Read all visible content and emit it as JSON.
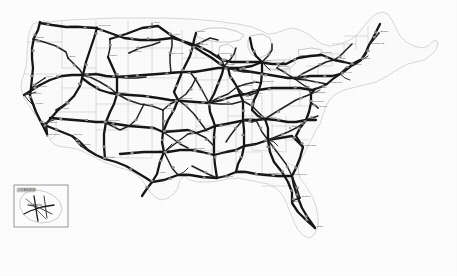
{
  "figure": {
    "kind": "scanned-map",
    "region": "Contiguous United States",
    "render_style": "grayscale line scan",
    "background_color": "#ffffff",
    "road_color": "#161616",
    "border_color": "#b9b9b9",
    "coast_color": "#9a9a9a",
    "width_px": 457,
    "height_px": 276,
    "title": "",
    "caption": "",
    "legend": ""
  },
  "inset": {
    "present": true,
    "label": "LOS ANGELES",
    "sub_label": "AREA",
    "box": {
      "x": 14,
      "y": 185,
      "w": 54,
      "h": 42
    }
  },
  "cities": [
    {
      "name": "Seattle",
      "x": 40,
      "y": 24
    },
    {
      "name": "Spokane",
      "x": 68,
      "y": 27
    },
    {
      "name": "Portland",
      "x": 33,
      "y": 39
    },
    {
      "name": "Boise",
      "x": 68,
      "y": 58
    },
    {
      "name": "Billings",
      "x": 110,
      "y": 39
    },
    {
      "name": "Great Falls",
      "x": 97,
      "y": 27
    },
    {
      "name": "Minot",
      "x": 152,
      "y": 24
    },
    {
      "name": "Fargo",
      "x": 172,
      "y": 36
    },
    {
      "name": "Duluth",
      "x": 196,
      "y": 33
    },
    {
      "name": "Minneapolis",
      "x": 193,
      "y": 46
    },
    {
      "name": "Rapid City",
      "x": 129,
      "y": 53
    },
    {
      "name": "Sioux Falls",
      "x": 170,
      "y": 55
    },
    {
      "name": "Casper",
      "x": 108,
      "y": 57
    },
    {
      "name": "Salt Lake City",
      "x": 83,
      "y": 75
    },
    {
      "name": "Reno",
      "x": 45,
      "y": 78
    },
    {
      "name": "Sacramento",
      "x": 32,
      "y": 88
    },
    {
      "name": "San Francisco",
      "x": 24,
      "y": 95
    },
    {
      "name": "Fresno",
      "x": 34,
      "y": 105
    },
    {
      "name": "Las Vegas",
      "x": 56,
      "y": 110
    },
    {
      "name": "Los Angeles",
      "x": 42,
      "y": 124
    },
    {
      "name": "San Diego",
      "x": 47,
      "y": 136
    },
    {
      "name": "Phoenix",
      "x": 72,
      "y": 136
    },
    {
      "name": "Tucson",
      "x": 81,
      "y": 146
    },
    {
      "name": "Albuquerque",
      "x": 104,
      "y": 122
    },
    {
      "name": "Denver",
      "x": 117,
      "y": 94
    },
    {
      "name": "Cheyenne",
      "x": 117,
      "y": 77
    },
    {
      "name": "El Paso",
      "x": 105,
      "y": 159
    },
    {
      "name": "Amarillo",
      "x": 129,
      "y": 126
    },
    {
      "name": "Oklahoma City",
      "x": 163,
      "y": 132
    },
    {
      "name": "Wichita",
      "x": 163,
      "y": 110
    },
    {
      "name": "Omaha",
      "x": 171,
      "y": 73
    },
    {
      "name": "Des Moines",
      "x": 190,
      "y": 72
    },
    {
      "name": "Kansas City",
      "x": 178,
      "y": 100
    },
    {
      "name": "St. Louis",
      "x": 209,
      "y": 103
    },
    {
      "name": "Chicago",
      "x": 224,
      "y": 66
    },
    {
      "name": "Milwaukee",
      "x": 218,
      "y": 55
    },
    {
      "name": "Detroit",
      "x": 262,
      "y": 62
    },
    {
      "name": "Indianapolis",
      "x": 237,
      "y": 87
    },
    {
      "name": "Cincinnati",
      "x": 250,
      "y": 95
    },
    {
      "name": "Louisville",
      "x": 243,
      "y": 101
    },
    {
      "name": "Cleveland",
      "x": 277,
      "y": 68
    },
    {
      "name": "Columbus",
      "x": 261,
      "y": 83
    },
    {
      "name": "Pittsburgh",
      "x": 295,
      "y": 79
    },
    {
      "name": "Buffalo",
      "x": 300,
      "y": 57
    },
    {
      "name": "Nashville",
      "x": 243,
      "y": 120
    },
    {
      "name": "Memphis",
      "x": 215,
      "y": 126
    },
    {
      "name": "Little Rock",
      "x": 196,
      "y": 133
    },
    {
      "name": "Dallas",
      "x": 164,
      "y": 152
    },
    {
      "name": "Fort Worth",
      "x": 157,
      "y": 152
    },
    {
      "name": "Austin",
      "x": 157,
      "y": 174
    },
    {
      "name": "San Antonio",
      "x": 152,
      "y": 182
    },
    {
      "name": "Houston",
      "x": 178,
      "y": 175
    },
    {
      "name": "New Orleans",
      "x": 217,
      "y": 178
    },
    {
      "name": "Shreveport",
      "x": 191,
      "y": 150
    },
    {
      "name": "Jackson",
      "x": 214,
      "y": 155
    },
    {
      "name": "Birmingham",
      "x": 244,
      "y": 146
    },
    {
      "name": "Atlanta",
      "x": 268,
      "y": 140
    },
    {
      "name": "Mobile",
      "x": 236,
      "y": 172
    },
    {
      "name": "Tallahassee",
      "x": 267,
      "y": 175
    },
    {
      "name": "Jacksonville",
      "x": 292,
      "y": 176
    },
    {
      "name": "Orlando",
      "x": 300,
      "y": 198
    },
    {
      "name": "Tampa",
      "x": 292,
      "y": 203
    },
    {
      "name": "Miami",
      "x": 315,
      "y": 228
    },
    {
      "name": "Knoxville",
      "x": 265,
      "y": 119
    },
    {
      "name": "Charlotte",
      "x": 290,
      "y": 128
    },
    {
      "name": "Charleston",
      "x": 303,
      "y": 147
    },
    {
      "name": "Raleigh",
      "x": 306,
      "y": 120
    },
    {
      "name": "Richmond",
      "x": 311,
      "y": 103
    },
    {
      "name": "Norfolk",
      "x": 318,
      "y": 108
    },
    {
      "name": "Washington",
      "x": 311,
      "y": 94
    },
    {
      "name": "Baltimore",
      "x": 315,
      "y": 89
    },
    {
      "name": "Philadelphia",
      "x": 327,
      "y": 84
    },
    {
      "name": "New York",
      "x": 340,
      "y": 74
    },
    {
      "name": "Hartford",
      "x": 351,
      "y": 66
    },
    {
      "name": "Boston",
      "x": 361,
      "y": 60
    },
    {
      "name": "Portland ME",
      "x": 369,
      "y": 45
    },
    {
      "name": "Albany",
      "x": 337,
      "y": 60
    },
    {
      "name": "Syracuse",
      "x": 320,
      "y": 54
    },
    {
      "name": "Bangor",
      "x": 379,
      "y": 33
    }
  ],
  "routes": [
    {
      "id": "I-5",
      "class": "major"
    },
    {
      "id": "I-10",
      "class": "major"
    },
    {
      "id": "I-15",
      "class": "major"
    },
    {
      "id": "I-20",
      "class": "major"
    },
    {
      "id": "I-25",
      "class": "major"
    },
    {
      "id": "I-35",
      "class": "major"
    },
    {
      "id": "I-40",
      "class": "major"
    },
    {
      "id": "I-55",
      "class": "major"
    },
    {
      "id": "I-65",
      "class": "major"
    },
    {
      "id": "I-70",
      "class": "major"
    },
    {
      "id": "I-75",
      "class": "major"
    },
    {
      "id": "I-80",
      "class": "major"
    },
    {
      "id": "I-90",
      "class": "major"
    },
    {
      "id": "I-94",
      "class": "major"
    },
    {
      "id": "I-95",
      "class": "major"
    }
  ]
}
